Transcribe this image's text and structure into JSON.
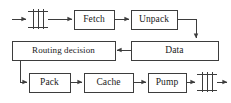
{
  "diagram": {
    "stroke_color": "#3d3d3d",
    "box_fill": "#ffffff",
    "background": "#ffffff",
    "nodes": [
      {
        "id": "input-gate",
        "label": "",
        "type": "register-bank-symbol",
        "x": 28,
        "y": 11,
        "w": 20,
        "h": 16
      },
      {
        "id": "fetch",
        "label": "Fetch",
        "type": "process-box",
        "x": 74,
        "y": 10,
        "w": 40,
        "h": 19
      },
      {
        "id": "unpack",
        "label": "Unpack",
        "type": "process-box",
        "x": 131,
        "y": 10,
        "w": 46,
        "h": 19
      },
      {
        "id": "data",
        "label": "Data",
        "type": "process-box",
        "x": 131,
        "y": 41,
        "w": 87,
        "h": 19
      },
      {
        "id": "routing-decision",
        "label": "Routing decision",
        "type": "process-box",
        "x": 12,
        "y": 41,
        "w": 103,
        "h": 19
      },
      {
        "id": "pack",
        "label": "Pack",
        "type": "process-box",
        "x": 29,
        "y": 73,
        "w": 41,
        "h": 19
      },
      {
        "id": "cache",
        "label": "Cache",
        "type": "process-box",
        "x": 84,
        "y": 73,
        "w": 49,
        "h": 19
      },
      {
        "id": "pump",
        "label": "Pump",
        "type": "process-box",
        "x": 148,
        "y": 73,
        "w": 38,
        "h": 19
      },
      {
        "id": "output-gate",
        "label": "",
        "type": "register-bank-symbol",
        "x": 197,
        "y": 74,
        "w": 20,
        "h": 16
      }
    ],
    "edges": [
      {
        "id": "edge-input-to-gate",
        "from": "external-input",
        "to": "input-gate",
        "arrow": true
      },
      {
        "id": "edge-gate-to-fetch",
        "from": "input-gate",
        "to": "fetch",
        "arrow": true
      },
      {
        "id": "edge-fetch-to-unpack",
        "from": "fetch",
        "to": "unpack",
        "arrow": true
      },
      {
        "id": "edge-unpack-to-data",
        "from": "unpack",
        "to": "data",
        "arrow": true
      },
      {
        "id": "edge-data-to-routing",
        "from": "data",
        "to": "routing-decision",
        "arrow": true
      },
      {
        "id": "edge-routing-to-pack",
        "from": "routing-decision",
        "to": "pack",
        "arrow": true
      },
      {
        "id": "edge-pack-to-cache",
        "from": "pack",
        "to": "cache",
        "arrow": true
      },
      {
        "id": "edge-cache-to-pump",
        "from": "cache",
        "to": "pump",
        "arrow": true
      },
      {
        "id": "edge-pump-to-gate",
        "from": "pump",
        "to": "output-gate",
        "arrow": true
      },
      {
        "id": "edge-gate-to-output",
        "from": "output-gate",
        "to": "external-output",
        "arrow": true
      }
    ]
  }
}
